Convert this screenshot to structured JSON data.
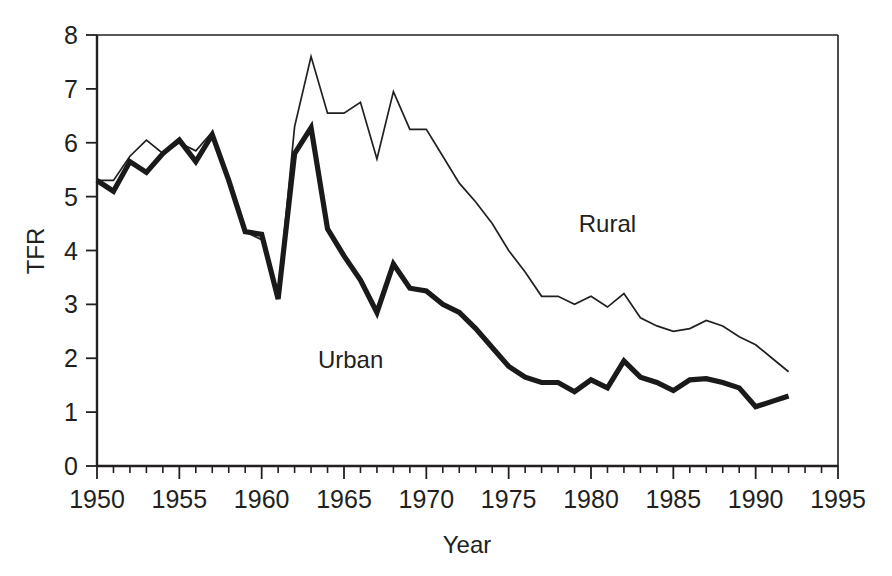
{
  "chart_data": {
    "type": "line",
    "title": "",
    "xlabel": "Year",
    "ylabel": "TFR",
    "xlim": [
      1950,
      1995
    ],
    "ylim": [
      0,
      8
    ],
    "grid": false,
    "legend_position": "inline-annotation",
    "x_major_ticks": [
      1950,
      1955,
      1960,
      1965,
      1970,
      1975,
      1980,
      1985,
      1990,
      1995
    ],
    "x_major_tick_labels": [
      "1950",
      "1955",
      "1960",
      "1965",
      "1970",
      "1975",
      "1980",
      "1985",
      "1990",
      "1995"
    ],
    "x_minor_tick_step": 1,
    "y_ticks": [
      0,
      1,
      2,
      3,
      4,
      5,
      6,
      7,
      8
    ],
    "y_tick_labels": [
      "0",
      "1",
      "2",
      "3",
      "4",
      "5",
      "6",
      "7",
      "8"
    ],
    "x": [
      1950,
      1951,
      1952,
      1953,
      1954,
      1955,
      1956,
      1957,
      1958,
      1959,
      1960,
      1961,
      1962,
      1963,
      1964,
      1965,
      1966,
      1967,
      1968,
      1969,
      1970,
      1971,
      1972,
      1973,
      1974,
      1975,
      1976,
      1977,
      1978,
      1979,
      1980,
      1981,
      1982,
      1983,
      1984,
      1985,
      1986,
      1987,
      1988,
      1989,
      1990,
      1991,
      1992
    ],
    "series": [
      {
        "name": "Rural",
        "label": "Rural",
        "style": "thin",
        "values": [
          5.3,
          5.3,
          5.75,
          6.05,
          5.8,
          6.0,
          5.85,
          6.2,
          5.35,
          4.35,
          4.2,
          3.15,
          6.3,
          7.6,
          6.55,
          6.55,
          6.75,
          5.7,
          6.95,
          6.25,
          6.25,
          5.75,
          5.25,
          4.9,
          4.5,
          4.0,
          3.6,
          3.15,
          3.15,
          3.0,
          3.15,
          2.95,
          3.2,
          2.75,
          2.6,
          2.5,
          2.55,
          2.7,
          2.6,
          2.4,
          2.25,
          2.0,
          1.75
        ]
      },
      {
        "name": "Urban",
        "label": "Urban",
        "style": "thick",
        "values": [
          5.3,
          5.1,
          5.65,
          5.45,
          5.8,
          6.05,
          5.65,
          6.15,
          5.3,
          4.35,
          4.3,
          3.1,
          5.8,
          6.28,
          4.4,
          3.9,
          3.45,
          2.85,
          3.75,
          3.3,
          3.25,
          3.0,
          2.85,
          2.55,
          2.2,
          1.85,
          1.65,
          1.55,
          1.55,
          1.38,
          1.6,
          1.45,
          1.95,
          1.65,
          1.55,
          1.4,
          1.6,
          1.62,
          1.55,
          1.45,
          1.1,
          1.2,
          1.3
        ]
      }
    ],
    "annotations": [
      {
        "text": "Rural",
        "x": 1981.0,
        "y": 4.35
      },
      {
        "text": "Urban",
        "x": 1965.4,
        "y": 1.82
      }
    ],
    "colors": {
      "line": "#231f20",
      "axis": "#231f20",
      "background": "#ffffff"
    }
  }
}
